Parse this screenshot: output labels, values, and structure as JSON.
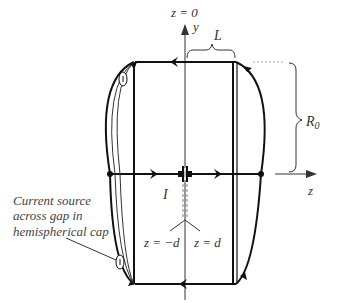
{
  "diagram": {
    "title_label": "z = 0",
    "axes": {
      "y_label": "y",
      "z_label": "z"
    },
    "dimensions": {
      "length_label": "L",
      "radius_label": "R",
      "radius_subscript": "0"
    },
    "current_label": "I",
    "gap_labels": {
      "left": "z = −d",
      "right": "z = d"
    },
    "annotation": {
      "line1": "Current source",
      "line2": "across gap in",
      "line3": "hemispherical cap"
    },
    "colors": {
      "stroke": "#111111",
      "thin_stroke": "#333333",
      "dashed": "#999999",
      "text": "#333333"
    }
  }
}
